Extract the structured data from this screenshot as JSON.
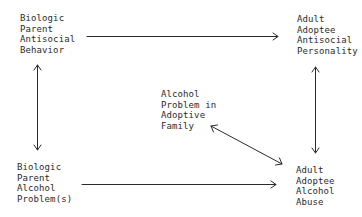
{
  "diagram": {
    "nodes": [
      {
        "id": "bio-antisocial",
        "lines": [
          "Biologic",
          "Parent",
          "Antisocial",
          "Behavior"
        ]
      },
      {
        "id": "adoptee-antisocial",
        "lines": [
          "Adult",
          "Adoptee",
          "Antisocial",
          "Personality"
        ]
      },
      {
        "id": "adoptive-family-alcohol",
        "lines": [
          "Alcohol",
          "Problem in",
          "Adoptive",
          "Family"
        ]
      },
      {
        "id": "bio-alcohol",
        "lines": [
          "Biologic",
          "Parent",
          "Alcohol",
          "Problem(s)"
        ]
      },
      {
        "id": "adoptee-alcohol",
        "lines": [
          "Adult",
          "Adoptee",
          "Alcohol",
          "Abuse"
        ]
      }
    ],
    "edges": [
      {
        "from": "bio-antisocial",
        "to": "adoptee-antisocial",
        "type": "directed"
      },
      {
        "from": "bio-alcohol",
        "to": "adoptee-alcohol",
        "type": "directed"
      },
      {
        "from": "bio-antisocial",
        "to": "bio-alcohol",
        "type": "bidirectional"
      },
      {
        "from": "adoptee-antisocial",
        "to": "adoptee-alcohol",
        "type": "bidirectional"
      },
      {
        "from": "adoptive-family-alcohol",
        "to": "adoptee-alcohol",
        "type": "bidirectional"
      }
    ]
  }
}
